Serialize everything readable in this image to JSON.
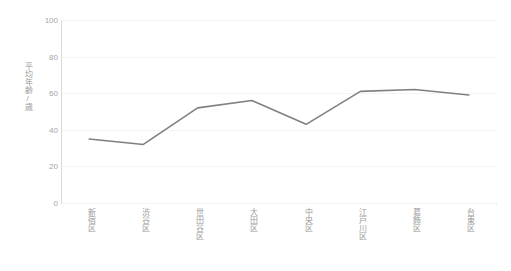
{
  "chart_data": {
    "type": "line",
    "title": "",
    "xlabel": "",
    "ylabel": "平均年齢/歳",
    "categories": [
      "新宿区",
      "渋谷区",
      "世田谷区",
      "大田区",
      "中央区",
      "江戸川区",
      "葛飾区",
      "台東区"
    ],
    "values": [
      35,
      32,
      52,
      56,
      43,
      61,
      62,
      59
    ],
    "series": [
      {
        "name": "平均年齢",
        "values": [
          35,
          32,
          52,
          56,
          43,
          61,
          62,
          59
        ]
      }
    ],
    "ylim": [
      0,
      100
    ],
    "yticks": [
      100,
      80,
      60,
      40,
      20,
      0
    ],
    "ytick_labels": [
      "100",
      "80",
      "60",
      "40",
      "20",
      "0"
    ],
    "grid": true,
    "grid_axis": "y",
    "legend": false,
    "legend_position": "none",
    "line_color": "#808080",
    "grid_color": "#f4f4f4",
    "axis_color": "#d9d9d9",
    "tick_label_color": "#a5a5a5",
    "background_color": "#ffffff",
    "markers": false
  }
}
